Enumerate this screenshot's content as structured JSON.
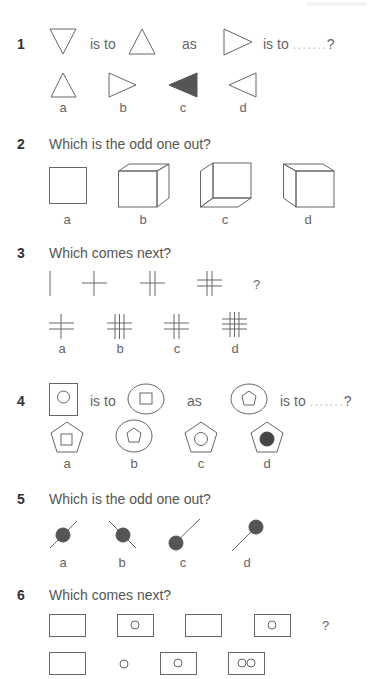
{
  "questions": [
    {
      "number": "1",
      "analogy": {
        "is_to": "is to",
        "as": "as",
        "is_to_2": "is to",
        "dots": ".......",
        "qmark": "?"
      },
      "options": [
        "a",
        "b",
        "c",
        "d"
      ],
      "figures": {
        "lhs": "triangle-down",
        "rhs": "triangle-up",
        "query": "triangle-right",
        "option_shapes": [
          "triangle-up",
          "triangle-right",
          "triangle-left-filled",
          "triangle-left"
        ]
      }
    },
    {
      "number": "2",
      "prompt": "Which is the odd one out?",
      "options": [
        "a",
        "b",
        "c",
        "d"
      ],
      "figures": [
        "square",
        "cube-top-right",
        "cube-bottom-left",
        "cube-top-left"
      ]
    },
    {
      "number": "3",
      "prompt": "Which comes next?",
      "sequence_qmark": "?",
      "sequence": [
        "1V",
        "1V1H",
        "2V1H",
        "2V2H"
      ],
      "options": [
        "a",
        "b",
        "c",
        "d"
      ],
      "option_figures": [
        "1V2H",
        "3V2H",
        "2V2H",
        "3V3H"
      ]
    },
    {
      "number": "4",
      "analogy": {
        "is_to": "is to",
        "as": "as",
        "is_to_2": "is to",
        "dots": ".......",
        "qmark": "?"
      },
      "options": [
        "a",
        "b",
        "c",
        "d"
      ],
      "figures": {
        "lhs": "square-containing-circle",
        "rhs": "circle-containing-square",
        "query": "circle-containing-pentagon",
        "option_shapes": [
          "pentagon-containing-square",
          "circle-containing-pentagon",
          "pentagon-containing-circle",
          "pentagon-containing-filled-circle"
        ]
      }
    },
    {
      "number": "5",
      "prompt": "Which is the odd one out?",
      "options": [
        "a",
        "b",
        "c",
        "d"
      ],
      "figures": [
        "ball-on-line-rising",
        "ball-on-line-falling",
        "ball-at-bottom-of-line",
        "ball-at-top-of-line"
      ]
    },
    {
      "number": "6",
      "prompt": "Which comes next?",
      "sequence_qmark": "?",
      "sequence": [
        "empty-rect",
        "rect-with-circle",
        "empty-rect",
        "rect-with-circle"
      ],
      "option_figures": [
        "empty-rect",
        "circle",
        "rect-with-circle",
        "rect-with-two-circles"
      ]
    }
  ],
  "colors": {
    "stroke": "#666666",
    "fill_dark": "#555555",
    "text": "#555555",
    "dots": "#c8c8c8"
  }
}
